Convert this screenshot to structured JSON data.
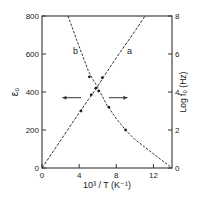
{
  "chart_data": {
    "type": "line",
    "title": "",
    "xlabel": "10^3 / T (K^-1)",
    "ylabel_left": "ε0",
    "ylabel_right": "Log f0 (Hz)",
    "xlim": [
      0,
      14
    ],
    "ylim_left": [
      0,
      800
    ],
    "ylim_right": [
      0,
      8
    ],
    "x_ticks": [
      "0",
      "4",
      "8",
      "12"
    ],
    "x_tick_values": [
      0,
      4,
      8,
      12
    ],
    "y_left_ticks": [
      "0",
      "200",
      "400",
      "600",
      "800"
    ],
    "y_left_tick_values": [
      0,
      200,
      400,
      600,
      800
    ],
    "y_right_ticks": [
      "0",
      "2",
      "4",
      "6",
      "8"
    ],
    "y_right_tick_values": [
      0,
      2,
      4,
      6,
      8
    ],
    "grid": false,
    "series": [
      {
        "name": "a",
        "axis": "right",
        "description": "Log f0 vs 10^3/T (straight line)",
        "style": "dashed with data points",
        "x": [
          0,
          2,
          4,
          5,
          5.5,
          6,
          6.5,
          8,
          10,
          11.1
        ],
        "y": [
          0,
          1.45,
          2.9,
          3.6,
          3.95,
          4.3,
          4.7,
          5.8,
          7.2,
          8.0
        ],
        "markers_x": [
          4.2,
          5.3,
          5.8,
          6.5
        ],
        "markers_y": [
          3.0,
          3.85,
          4.2,
          4.75
        ]
      },
      {
        "name": "b",
        "axis": "left",
        "description": "ε0 vs 10^3/T (decreasing curve)",
        "style": "dashed extrapolation, solid through data",
        "x": [
          2.8,
          4,
          5,
          5.5,
          6,
          7,
          8,
          9,
          10,
          12,
          14
        ],
        "y": [
          800,
          640,
          510,
          465,
          425,
          330,
          260,
          200,
          150,
          75,
          0
        ],
        "markers_x": [
          5.1,
          6.1,
          7.2,
          9.0
        ],
        "markers_y": [
          480,
          405,
          320,
          200
        ]
      }
    ],
    "annotations": [
      {
        "text": "a",
        "x": 8.9,
        "y_left": 600
      },
      {
        "text": "b",
        "x": 3.5,
        "y_left": 600
      },
      {
        "text": "arrow-left",
        "from_x": 4.2,
        "to_x": 2.2,
        "y_left": 370,
        "meaning": "curve b refers to left axis"
      },
      {
        "text": "arrow-right",
        "from_x": 7.2,
        "to_x": 9.2,
        "y_left": 370,
        "meaning": "curve a refers to right axis"
      }
    ],
    "legend": "none (curves labelled a, b inline)"
  },
  "labels": {
    "x_axis": "10³ / T (K⁻¹)",
    "y_left": "ε₀",
    "y_right": "Log f₀ (Hz)",
    "curve_a": "a",
    "curve_b": "b"
  }
}
